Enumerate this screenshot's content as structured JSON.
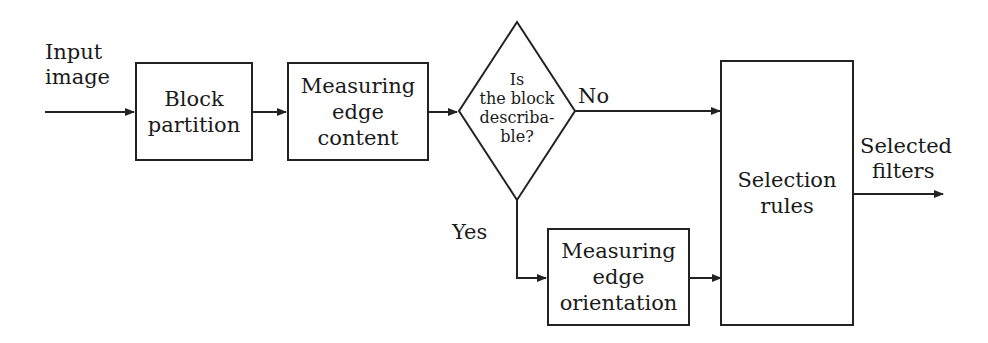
{
  "diagram": {
    "input_label": [
      "Input",
      "image"
    ],
    "nodes": {
      "block_partition": [
        "Block",
        "partition"
      ],
      "edge_content": [
        "Measuring",
        "edge",
        "content"
      ],
      "decision": [
        "Is",
        "the block",
        "describa-",
        "ble?"
      ],
      "edge_orientation": [
        "Measuring",
        "edge",
        "orientation"
      ],
      "selection_rules": [
        "Selection",
        "rules"
      ]
    },
    "edges": {
      "no_label": "No",
      "yes_label": "Yes"
    },
    "output_label": [
      "Selected",
      "filters"
    ]
  }
}
